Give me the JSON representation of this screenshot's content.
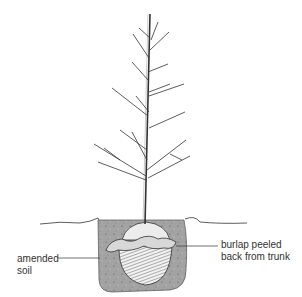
{
  "diagram": {
    "labels": {
      "amended_soil": "amended\nsoil",
      "burlap": "burlap peeled\nback from trunk"
    },
    "colors": {
      "ink": "#333333",
      "soil": "#a0a0a0",
      "soil_dark": "#6e6e6e",
      "root_ball": "#e8e8e8",
      "background": "#ffffff"
    }
  }
}
